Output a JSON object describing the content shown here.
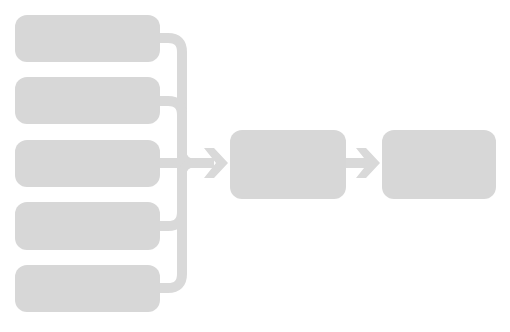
{
  "diagram": {
    "type": "flow",
    "colors": {
      "node_fill": "#d7d7d7",
      "connector": "#d9d9d9",
      "background": "#ffffff"
    },
    "input_nodes": [
      {
        "id": "input-1",
        "label": ""
      },
      {
        "id": "input-2",
        "label": ""
      },
      {
        "id": "input-3",
        "label": ""
      },
      {
        "id": "input-4",
        "label": ""
      },
      {
        "id": "input-5",
        "label": ""
      }
    ],
    "process_node": {
      "id": "process",
      "label": ""
    },
    "output_node": {
      "id": "output",
      "label": ""
    },
    "edges": [
      {
        "from": "input-1",
        "to": "process"
      },
      {
        "from": "input-2",
        "to": "process"
      },
      {
        "from": "input-3",
        "to": "process"
      },
      {
        "from": "input-4",
        "to": "process"
      },
      {
        "from": "input-5",
        "to": "process"
      },
      {
        "from": "process",
        "to": "output"
      }
    ]
  }
}
